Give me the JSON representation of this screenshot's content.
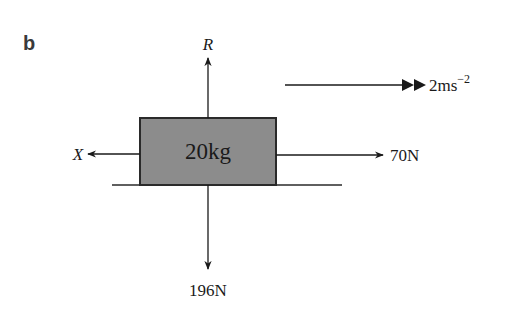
{
  "part_label": "b",
  "diagram": {
    "type": "free-body-diagram",
    "block": {
      "mass_label": "20kg",
      "fill": "#8c8c8c",
      "stroke": "#2a2a2a"
    },
    "forces": [
      {
        "name": "R",
        "direction": "up",
        "label": "R"
      },
      {
        "name": "weight",
        "direction": "down",
        "label": "196N"
      },
      {
        "name": "X",
        "direction": "left",
        "label": "X"
      },
      {
        "name": "applied",
        "direction": "right",
        "label": "70N"
      }
    ],
    "acceleration": {
      "label": "2ms",
      "exponent": "−2",
      "direction": "right"
    },
    "surface": "horizontal-line"
  }
}
